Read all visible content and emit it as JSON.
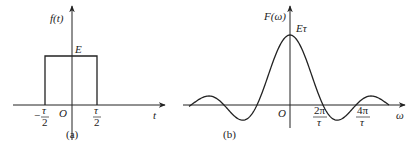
{
  "panel_a": {
    "y_label": "f(t)",
    "height_label": "E",
    "origin_label": "O",
    "left_tick": {
      "sign": "−",
      "num": "τ",
      "den": "2"
    },
    "right_tick": {
      "num": "τ",
      "den": "2"
    },
    "x_label": "t",
    "caption": "(a)"
  },
  "panel_b": {
    "y_label": "F(ω)",
    "peak_label": "Eτ",
    "origin_label": "O",
    "tick1": {
      "num": "2π",
      "den": "τ"
    },
    "tick2": {
      "num": "4π",
      "den": "τ"
    },
    "x_label": "ω",
    "caption": "(b)"
  },
  "colors": {
    "stroke": "#222222",
    "background": "#ffffff"
  }
}
